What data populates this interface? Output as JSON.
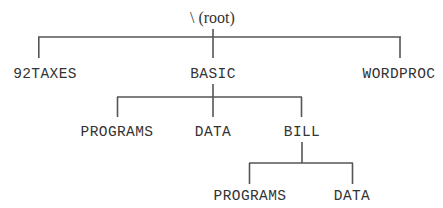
{
  "diagram": {
    "type": "directory-tree",
    "root": {
      "label": "\\ (root)"
    },
    "level1": [
      {
        "label": "92TAXES"
      },
      {
        "label": "BASIC"
      },
      {
        "label": "WORDPROC"
      }
    ],
    "basic_children": [
      {
        "label": "PROGRAMS"
      },
      {
        "label": "DATA"
      },
      {
        "label": "BILL"
      }
    ],
    "bill_children": [
      {
        "label": "PROGRAMS"
      },
      {
        "label": "DATA"
      }
    ],
    "colors": {
      "line": "#555555",
      "text": "#333333",
      "background": "#ffffff"
    }
  }
}
